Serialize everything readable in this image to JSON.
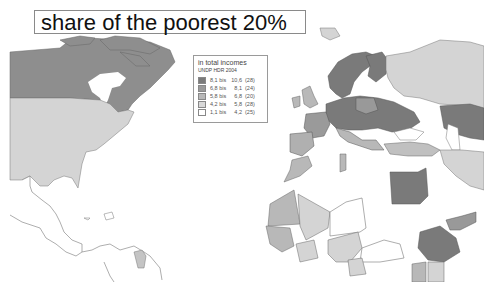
{
  "title": "share of the poorest 20%",
  "legend": {
    "title_line1": "in total incomes",
    "title_line2": "UNDP HDR 2004",
    "classes": [
      {
        "low": "8,1",
        "sep": "bis",
        "high": "10,6",
        "count": "(28)",
        "color": "#7a7a7a"
      },
      {
        "low": "6,8",
        "sep": "bis",
        "high": "8,1",
        "count": "(24)",
        "color": "#999999"
      },
      {
        "low": "5,8",
        "sep": "bis",
        "high": "6,8",
        "count": "(20)",
        "color": "#b8b8b8"
      },
      {
        "low": "4,2",
        "sep": "bis",
        "high": "5,8",
        "count": "(28)",
        "color": "#d8d8d8"
      },
      {
        "low": "1,1",
        "sep": "bis",
        "high": "4,2",
        "count": "(25)",
        "color": "#ffffff"
      }
    ]
  },
  "colors": {
    "class1": "#7a7a7a",
    "class2": "#999999",
    "class3": "#b8b8b8",
    "class4": "#d8d8d8",
    "class5": "#ffffff",
    "border": "#555555"
  }
}
